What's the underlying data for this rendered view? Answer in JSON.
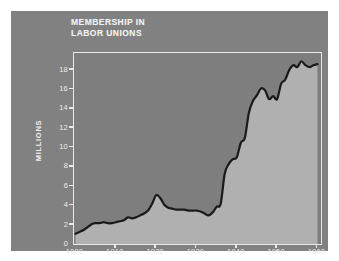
{
  "figure": {
    "title": "MEMBERSHIP IN\nLABOR UNIONS",
    "card_color": "#818181",
    "plot_bg_color": "#7e7e7e",
    "fill_color": "#b0b0b0",
    "line_color": "#1a1a1a",
    "frame_color": "#e8e8e8",
    "text_color": "#ededed"
  },
  "axes": {
    "ylabel": "MILLIONS",
    "yticks": [
      {
        "value": 0,
        "label": "0"
      },
      {
        "value": 2,
        "label": "2"
      },
      {
        "value": 4,
        "label": "4"
      },
      {
        "value": 6,
        "label": "6"
      },
      {
        "value": 8,
        "label": "8"
      },
      {
        "value": 10,
        "label": "10"
      },
      {
        "value": 12,
        "label": "12"
      },
      {
        "value": 14,
        "label": "14"
      },
      {
        "value": 16,
        "label": "16"
      },
      {
        "value": 18,
        "label": "18"
      }
    ],
    "xticks": [
      {
        "value": 1900,
        "label": "1900"
      },
      {
        "value": 1910,
        "label": "1910"
      },
      {
        "value": 1920,
        "label": "1920"
      },
      {
        "value": 1930,
        "label": "1930"
      },
      {
        "value": 1940,
        "label": "1940"
      },
      {
        "value": 1950,
        "label": "1950"
      },
      {
        "value": 1960,
        "label": "1960"
      }
    ]
  },
  "chart_data": {
    "type": "area",
    "title": "MEMBERSHIP IN LABOR UNIONS",
    "xlabel": "",
    "ylabel": "MILLIONS",
    "xlim": [
      1900,
      1961
    ],
    "ylim": [
      0,
      19.6
    ],
    "grid": false,
    "legend": false,
    "x": [
      1900,
      1901,
      1902,
      1903,
      1904,
      1905,
      1906,
      1907,
      1908,
      1909,
      1910,
      1911,
      1912,
      1913,
      1914,
      1915,
      1916,
      1917,
      1918,
      1919,
      1920,
      1921,
      1922,
      1923,
      1924,
      1925,
      1926,
      1927,
      1928,
      1929,
      1930,
      1931,
      1932,
      1933,
      1934,
      1935,
      1936,
      1937,
      1938,
      1939,
      1940,
      1941,
      1942,
      1943,
      1944,
      1945,
      1946,
      1947,
      1948,
      1949,
      1950,
      1951,
      1952,
      1953,
      1954,
      1955,
      1956,
      1957,
      1958,
      1959,
      1960
    ],
    "y": [
      1.1,
      1.3,
      1.5,
      1.8,
      2.1,
      2.2,
      2.2,
      2.3,
      2.2,
      2.2,
      2.3,
      2.4,
      2.5,
      2.8,
      2.7,
      2.8,
      3.0,
      3.2,
      3.5,
      4.2,
      5.1,
      4.8,
      4.1,
      3.8,
      3.7,
      3.6,
      3.6,
      3.6,
      3.5,
      3.5,
      3.5,
      3.4,
      3.2,
      3.0,
      3.3,
      3.9,
      4.2,
      7.3,
      8.3,
      8.8,
      9.0,
      10.5,
      11.0,
      13.6,
      14.8,
      15.4,
      16.1,
      15.9,
      15.0,
      15.3,
      15.0,
      16.6,
      17.0,
      18.0,
      18.5,
      18.3,
      18.9,
      18.5,
      18.3,
      18.5,
      18.6
    ]
  }
}
